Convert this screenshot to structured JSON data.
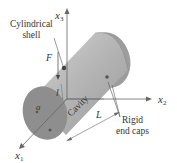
{
  "diagram": {
    "axes": {
      "x1": {
        "base": "x",
        "sub": "1"
      },
      "x2": {
        "base": "x",
        "sub": "2"
      },
      "x3": {
        "base": "x",
        "sub": "3"
      }
    },
    "labels": {
      "shell_line1": "Cylindrical",
      "shell_line2": "shell",
      "force": "F",
      "small_length": "l",
      "radius": "a",
      "cavity": "Cavity",
      "length": "L",
      "caps_line1": "Rigid",
      "caps_line2": "end caps"
    },
    "colors": {
      "cylinder_body": "#a8a8a8",
      "cylinder_top": "#c8c8c8",
      "end_cap": "#8e8e8e",
      "axis": "#666666",
      "text": "#333333"
    }
  }
}
